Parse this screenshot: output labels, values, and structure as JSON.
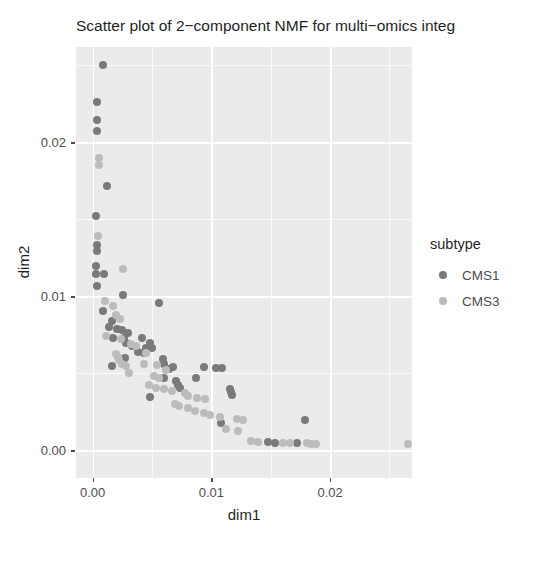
{
  "chart_data": {
    "type": "scatter",
    "title": "Scatter plot of 2−component NMF for multi−omics integ",
    "title_full": "Scatter plot of 2−component NMF for multi−omics integration",
    "title_truncated": true,
    "xlabel": "dim1",
    "ylabel": "dim2",
    "xlim": [
      -0.0014,
      0.0269
    ],
    "ylim": [
      -0.0018,
      0.0262
    ],
    "xticks": [
      0.0,
      0.01,
      0.02
    ],
    "xtick_labels": [
      "0.00",
      "0.01",
      "0.02"
    ],
    "yticks": [
      0.0,
      0.01,
      0.02
    ],
    "ytick_labels": [
      "0.00",
      "0.01",
      "0.02"
    ],
    "x_minor_ticks": [
      0.005,
      0.015,
      0.025
    ],
    "y_minor_ticks": [
      0.005,
      0.015,
      0.025
    ],
    "grid": true,
    "grid_color": "#ffffff",
    "panel_background": "#ebebeb",
    "legend": {
      "title": "subtype",
      "position": "right",
      "entries": [
        {
          "name": "CMS1",
          "color": "#7a7a7a"
        },
        {
          "name": "CMS3",
          "color": "#bcbcbc"
        }
      ]
    },
    "series": [
      {
        "name": "CMS1",
        "color": "#7a7a7a",
        "points": [
          [
            0.0009,
            0.02505
          ],
          [
            0.00035,
            0.02265
          ],
          [
            0.0004,
            0.02145
          ],
          [
            0.0004,
            0.02075
          ],
          [
            0.00125,
            0.01715
          ],
          [
            0.0003,
            0.01525
          ],
          [
            0.0004,
            0.01335
          ],
          [
            0.00035,
            0.01295
          ],
          [
            0.00032,
            0.01195
          ],
          [
            0.00032,
            0.01145
          ],
          [
            0.001,
            0.01145
          ],
          [
            0.00036,
            0.01065
          ],
          [
            0.0009,
            0.00905
          ],
          [
            0.00165,
            0.0084
          ],
          [
            0.00135,
            0.008
          ],
          [
            0.00205,
            0.0079
          ],
          [
            0.00245,
            0.0078
          ],
          [
            0.003,
            0.00765
          ],
          [
            0.00175,
            0.0073
          ],
          [
            0.00265,
            0.0073
          ],
          [
            0.00415,
            0.0073
          ],
          [
            0.0048,
            0.007
          ],
          [
            0.0028,
            0.00695
          ],
          [
            0.00335,
            0.0068
          ],
          [
            0.0045,
            0.00665
          ],
          [
            0.005,
            0.00665
          ],
          [
            0.0038,
            0.0064
          ],
          [
            0.00435,
            0.00635
          ],
          [
            0.00275,
            0.006
          ],
          [
            0.0059,
            0.0059
          ],
          [
            0.00165,
            0.00545
          ],
          [
            0.00605,
            0.0056
          ],
          [
            0.0068,
            0.0054
          ],
          [
            0.00645,
            0.0053
          ],
          [
            0.00935,
            0.0054
          ],
          [
            0.01035,
            0.00535
          ],
          [
            0.0109,
            0.00535
          ],
          [
            0.006,
            0.0047
          ],
          [
            0.0087,
            0.0047
          ],
          [
            0.007,
            0.0045
          ],
          [
            0.0072,
            0.00425
          ],
          [
            0.00735,
            0.00405
          ],
          [
            0.01155,
            0.004
          ],
          [
            0.01165,
            0.0038
          ],
          [
            0.01175,
            0.0036
          ],
          [
            0.01085,
            0.0018
          ],
          [
            0.01785,
            0.00195
          ],
          [
            0.0148,
            0.00055
          ],
          [
            0.0154,
            0.0005
          ],
          [
            0.0172,
            0.00045
          ],
          [
            0.0048,
            0.00345
          ],
          [
            0.00555,
            0.0096
          ],
          [
            0.00255,
            0.0101
          ]
        ]
      },
      {
        "name": "CMS3",
        "color": "#bcbcbc",
        "points": [
          [
            0.0005,
            0.019
          ],
          [
            0.0005,
            0.01855
          ],
          [
            0.00045,
            0.0139
          ],
          [
            0.0026,
            0.0118
          ],
          [
            0.00105,
            0.0097
          ],
          [
            0.00175,
            0.0094
          ],
          [
            0.00195,
            0.0088
          ],
          [
            0.0023,
            0.00855
          ],
          [
            0.00115,
            0.00745
          ],
          [
            0.0024,
            0.0072
          ],
          [
            0.0032,
            0.0069
          ],
          [
            0.00365,
            0.0068
          ],
          [
            0.00195,
            0.00625
          ],
          [
            0.00215,
            0.00605
          ],
          [
            0.00225,
            0.00585
          ],
          [
            0.00245,
            0.0056
          ],
          [
            0.00285,
            0.00545
          ],
          [
            0.0043,
            0.0056
          ],
          [
            0.00545,
            0.00555
          ],
          [
            0.0062,
            0.0052
          ],
          [
            0.0031,
            0.00505
          ],
          [
            0.0052,
            0.00485
          ],
          [
            0.00555,
            0.0047
          ],
          [
            0.00475,
            0.00425
          ],
          [
            0.0053,
            0.00405
          ],
          [
            0.006,
            0.00395
          ],
          [
            0.0067,
            0.00385
          ],
          [
            0.0078,
            0.00375
          ],
          [
            0.008,
            0.0035
          ],
          [
            0.0088,
            0.0034
          ],
          [
            0.0095,
            0.0033
          ],
          [
            0.0086,
            0.00255
          ],
          [
            0.00935,
            0.0024
          ],
          [
            0.0099,
            0.0023
          ],
          [
            0.0107,
            0.00215
          ],
          [
            0.0122,
            0.00205
          ],
          [
            0.01265,
            0.00195
          ],
          [
            0.0112,
            0.0014
          ],
          [
            0.01225,
            0.00125
          ],
          [
            0.0133,
            0.0006
          ],
          [
            0.0139,
            0.00055
          ],
          [
            0.016,
            0.0005
          ],
          [
            0.01665,
            0.00048
          ],
          [
            0.01805,
            0.00045
          ],
          [
            0.0184,
            0.00043
          ],
          [
            0.01885,
            0.00042
          ],
          [
            0.0266,
            0.0004
          ],
          [
            0.0069,
            0.003
          ],
          [
            0.0073,
            0.00285
          ],
          [
            0.00805,
            0.00275
          ],
          [
            0.0045,
            0.0063
          ]
        ]
      }
    ]
  }
}
